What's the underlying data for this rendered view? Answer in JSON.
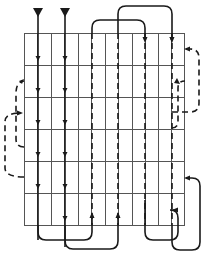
{
  "diagram": {
    "type": "flow-path-grid",
    "colors": {
      "background": "#ffffff",
      "grid_line": "#555555",
      "path_line": "#1a1a1a"
    },
    "grid": {
      "left": 24,
      "top": 33,
      "right": 184,
      "bottom": 225,
      "columns": 12,
      "rows": 6
    },
    "inlets": [
      {
        "x": 38,
        "label": ""
      },
      {
        "x": 65,
        "label": ""
      }
    ],
    "passes": [
      {
        "x": 38,
        "style": "solid",
        "direction": "down"
      },
      {
        "x": 65,
        "style": "solid",
        "direction": "down"
      },
      {
        "x": 92,
        "style": "dashed",
        "direction": "up"
      },
      {
        "x": 118,
        "style": "dashed",
        "direction": "down"
      },
      {
        "x": 145,
        "style": "dashed",
        "direction": "up"
      },
      {
        "x": 172,
        "style": "dashed",
        "direction": "down"
      }
    ],
    "loops": {
      "top": 2,
      "bottom": 2,
      "left": 2,
      "right": 4
    }
  }
}
